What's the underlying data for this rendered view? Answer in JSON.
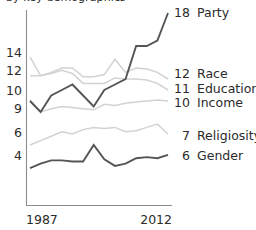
{
  "title": {
    "text": "by key demographics",
    "clipped": true
  },
  "axes": {
    "x_start_label": "1987",
    "x_end_label": "2012",
    "y_tick_labels": [
      "14",
      "12",
      "10",
      "9",
      "6",
      "4"
    ],
    "y_tick_values": [
      14,
      12,
      10,
      9,
      6,
      4
    ]
  },
  "colors": {
    "dark": "#555555",
    "light": "#d2d2d2",
    "light_alt": "#c9c9c9",
    "axis": "#8d8d8d",
    "text": "#2b2b2b"
  },
  "legend": [
    {
      "value": "18",
      "label": "Party"
    },
    {
      "value": "12",
      "label": "Race"
    },
    {
      "value": "11",
      "label": "Education"
    },
    {
      "value": "10",
      "label": "Income"
    },
    {
      "value": "7",
      "label": "Religiosity"
    },
    {
      "value": "6",
      "label": "Gender"
    }
  ],
  "chart_data": {
    "type": "line",
    "title": "by key demographics",
    "xlabel": "",
    "ylabel": "",
    "xlim": [
      1987,
      2012
    ],
    "ylim": [
      0,
      19
    ],
    "grid": false,
    "legend_position": "right-end-of-line",
    "x": [
      1987,
      1989,
      1991,
      1993,
      1995,
      1997,
      1999,
      2001,
      2003,
      2005,
      2007,
      2009,
      2011,
      2012
    ],
    "series": [
      {
        "name": "Party",
        "end_value": 18,
        "color": "#555555",
        "values": [
          10,
          9,
          10.5,
          11,
          11.5,
          10.5,
          9.5,
          11,
          11.5,
          12,
          15,
          15,
          15.5,
          18
        ]
      },
      {
        "name": "Race",
        "end_value": 12,
        "color": "#d2d2d2",
        "values": [
          14,
          12.3,
          12.6,
          13,
          13,
          12.2,
          12.2,
          12.4,
          13.8,
          12.6,
          13,
          12.9,
          12.6,
          12
        ]
      },
      {
        "name": "Education",
        "end_value": 11,
        "color": "#d2d2d2",
        "values": [
          12.3,
          12.3,
          12.5,
          12.8,
          12.5,
          11.6,
          11.6,
          11.6,
          12.1,
          12,
          12,
          11.9,
          11.6,
          11
        ]
      },
      {
        "name": "Income",
        "end_value": 10,
        "color": "#d2d2d2",
        "values": [
          10.1,
          9.0,
          9.3,
          9.5,
          9.4,
          9.3,
          9.2,
          9.7,
          9.6,
          9.8,
          9.9,
          10,
          10.1,
          10
        ]
      },
      {
        "name": "Religiosity",
        "end_value": 7,
        "color": "#d2d2d2",
        "values": [
          6.0,
          6.4,
          6.8,
          7.2,
          7.0,
          7.4,
          7.6,
          7.5,
          7.6,
          7.2,
          7.3,
          7.6,
          7.9,
          7
        ]
      },
      {
        "name": "Gender",
        "end_value": 6,
        "color": "#555555",
        "values": [
          3.9,
          4.3,
          4.6,
          4.6,
          4.5,
          4.5,
          6.0,
          4.7,
          4.1,
          4.3,
          4.8,
          4.9,
          4.8,
          5.1
        ]
      }
    ]
  }
}
